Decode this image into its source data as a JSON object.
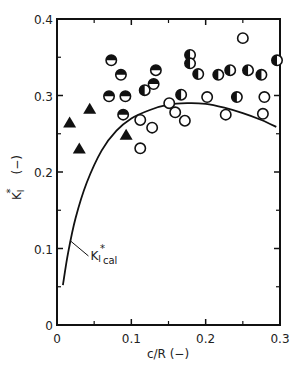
{
  "chart_data": {
    "type": "scatter",
    "title": "",
    "xlabel": "c/R (−)",
    "ylabel": "KI* (−)",
    "ylabel_main": "K",
    "ylabel_sub": "I",
    "ylabel_sup": "*",
    "ylabel_unit": "(−)",
    "xlim": [
      0,
      0.3
    ],
    "ylim": [
      0,
      0.4
    ],
    "grid": false,
    "legend": null,
    "x_ticks": [
      {
        "value": 0,
        "label": "0"
      },
      {
        "value": 0.1,
        "label": "0.1"
      },
      {
        "value": 0.2,
        "label": "0.2"
      },
      {
        "value": 0.3,
        "label": "0.3"
      }
    ],
    "x_minor_ticks": [
      0.05,
      0.15,
      0.25
    ],
    "y_ticks": [
      {
        "value": 0,
        "label": "0"
      },
      {
        "value": 0.1,
        "label": "0.1"
      },
      {
        "value": 0.2,
        "label": "0.2"
      },
      {
        "value": 0.3,
        "label": "0.3"
      },
      {
        "value": 0.4,
        "label": "0.4"
      }
    ],
    "y_minor_ticks": [
      0.05,
      0.15,
      0.25,
      0.35
    ],
    "series": [
      {
        "name": "filled triangles",
        "marker": "triangle-filled",
        "points": [
          [
            0.017,
            0.264
          ],
          [
            0.044,
            0.282
          ],
          [
            0.03,
            0.23
          ],
          [
            0.093,
            0.248
          ]
        ]
      },
      {
        "name": "top-half filled circles",
        "marker": "circle-top-half",
        "points": [
          [
            0.073,
            0.346
          ],
          [
            0.086,
            0.327
          ],
          [
            0.07,
            0.299
          ],
          [
            0.092,
            0.299
          ],
          [
            0.089,
            0.275
          ],
          [
            0.133,
            0.333
          ],
          [
            0.13,
            0.315
          ]
        ]
      },
      {
        "name": "side-half filled circles",
        "marker": "circle-left-half",
        "points": [
          [
            0.118,
            0.307
          ],
          [
            0.179,
            0.353
          ],
          [
            0.179,
            0.342
          ],
          [
            0.19,
            0.328
          ],
          [
            0.167,
            0.301
          ],
          [
            0.217,
            0.327
          ],
          [
            0.233,
            0.333
          ],
          [
            0.242,
            0.298
          ],
          [
            0.257,
            0.333
          ],
          [
            0.275,
            0.327
          ],
          [
            0.296,
            0.346
          ]
        ]
      },
      {
        "name": "open circles",
        "marker": "circle-open",
        "points": [
          [
            0.25,
            0.375
          ],
          [
            0.279,
            0.298
          ],
          [
            0.277,
            0.276
          ],
          [
            0.202,
            0.298
          ],
          [
            0.227,
            0.275
          ],
          [
            0.151,
            0.29
          ],
          [
            0.159,
            0.278
          ],
          [
            0.172,
            0.267
          ],
          [
            0.112,
            0.268
          ],
          [
            0.128,
            0.258
          ],
          [
            0.112,
            0.231
          ]
        ]
      },
      {
        "name": "KI*cal",
        "marker": "line",
        "points": [
          [
            0.008,
            0.052
          ],
          [
            0.015,
            0.095
          ],
          [
            0.025,
            0.14
          ],
          [
            0.04,
            0.186
          ],
          [
            0.06,
            0.228
          ],
          [
            0.08,
            0.254
          ],
          [
            0.1,
            0.27
          ],
          [
            0.125,
            0.281
          ],
          [
            0.15,
            0.288
          ],
          [
            0.175,
            0.29
          ],
          [
            0.2,
            0.289
          ],
          [
            0.225,
            0.284
          ],
          [
            0.25,
            0.277
          ],
          [
            0.275,
            0.268
          ],
          [
            0.295,
            0.259
          ]
        ]
      }
    ],
    "annotations": [
      {
        "text": "KI*cal",
        "main": "K",
        "sub": "I",
        "sup": "*",
        "sub2": "cal",
        "points_to": [
          0.018,
          0.11
        ],
        "text_at": [
          0.045,
          0.085
        ]
      }
    ]
  }
}
